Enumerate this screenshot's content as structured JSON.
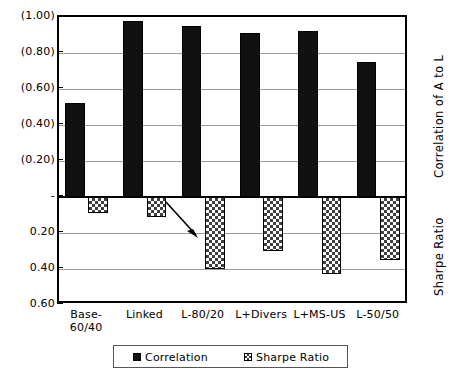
{
  "chart_data": {
    "type": "bar",
    "title": "",
    "xlabel": "",
    "ylabel_primary": "Correlation of A to L",
    "ylabel_secondary": "Sharpe Ratio",
    "categories": [
      "Base-60/40",
      "Linked",
      "L-80/20",
      "L+Divers",
      "L+MS-US",
      "L-50/50"
    ],
    "category_lines": [
      [
        "Base-",
        "60/40"
      ],
      [
        "Linked"
      ],
      [
        "L-80/20"
      ],
      [
        "L+Divers"
      ],
      [
        "L+MS-US"
      ],
      [
        "L-50/50"
      ]
    ],
    "series": [
      {
        "name": "Correlation",
        "color": "#111111",
        "pattern": "solid",
        "values": [
          0.52,
          0.98,
          0.95,
          0.91,
          0.92,
          0.75
        ]
      },
      {
        "name": "Sharpe Ratio",
        "color": "#404040",
        "pattern": "checker",
        "values": [
          -0.09,
          -0.11,
          -0.4,
          -0.3,
          -0.43,
          -0.35
        ]
      }
    ],
    "ytick_labels": [
      "(1.00)",
      "(0.80)",
      "(0.60)",
      "(0.40)",
      "(0.20)",
      "-",
      "0.20",
      "0.40",
      "0.60"
    ],
    "ytick_values": [
      1.0,
      0.8,
      0.6,
      0.4,
      0.2,
      0.0,
      -0.2,
      -0.4,
      -0.6
    ],
    "ylim": [
      -0.6,
      1.0
    ],
    "grid": true,
    "legend_position": "bottom",
    "legend_entries": [
      "Correlation",
      "Sharpe Ratio"
    ],
    "annotations": [
      {
        "type": "arrow",
        "target_category": "L-80/20",
        "target_series": "Sharpe Ratio"
      }
    ]
  }
}
